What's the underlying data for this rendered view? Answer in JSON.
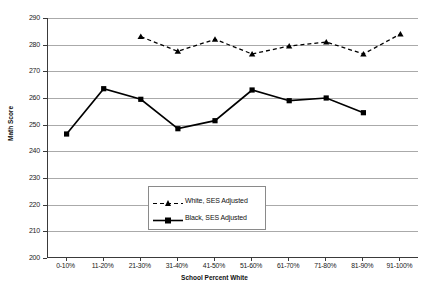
{
  "chart_data": {
    "type": "line",
    "title": "",
    "xlabel": "School Percent White",
    "ylabel": "Math Score",
    "ylim": [
      200,
      290
    ],
    "ytick_step": 10,
    "yticks": [
      290,
      280,
      270,
      260,
      250,
      240,
      230,
      220,
      210,
      200
    ],
    "grid": true,
    "legend_position": "lower-center-inside",
    "categories": [
      "0-10%",
      "11-20%",
      "21-30%",
      "31-40%",
      "41-50%",
      "51-60%",
      "61-70%",
      "71-80%",
      "81-90%",
      "91-100%"
    ],
    "series": [
      {
        "name": "White, SES Adjusted",
        "marker": "triangle",
        "linestyle": "dashed",
        "color": "#000000",
        "values": [
          null,
          null,
          283.0,
          277.5,
          282.0,
          276.5,
          279.5,
          281.0,
          276.5,
          284.0
        ]
      },
      {
        "name": "Black, SES Adjusted",
        "marker": "square",
        "linestyle": "solid",
        "color": "#000000",
        "values": [
          246.5,
          263.5,
          259.5,
          248.5,
          251.5,
          263.0,
          259.0,
          260.0,
          254.5,
          null
        ]
      }
    ]
  },
  "axes": {
    "y_title": "Math Score",
    "x_title": "School Percent White"
  },
  "legend": {
    "entries": [
      {
        "label": "White, SES Adjusted",
        "key": "dashed-triangle"
      },
      {
        "label": "Black, SES Adjusted",
        "key": "solid-square"
      }
    ]
  },
  "colors": {
    "series": "#000000",
    "gridline": "#aaaaaa",
    "axis": "#3a3a3a",
    "background": "#ffffff"
  }
}
